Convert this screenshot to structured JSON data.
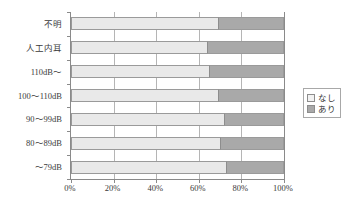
{
  "chart_data": {
    "type": "bar",
    "orientation": "horizontal",
    "stacked": true,
    "normalized": true,
    "title": "",
    "xlabel": "",
    "ylabel": "",
    "xlim": [
      0,
      100
    ],
    "grid": true,
    "legend_position": "right",
    "xticks": [
      "0%",
      "20%",
      "40%",
      "60%",
      "80%",
      "100%"
    ],
    "xtick_values": [
      0,
      20,
      40,
      60,
      80,
      100
    ],
    "categories": [
      "不明",
      "人工内耳",
      "110dB～",
      "100～110dB",
      "90～99dB",
      "80～89dB",
      "～79dB"
    ],
    "series": [
      {
        "name": "なし",
        "color": "#e9e9e9",
        "values": [
          69,
          64,
          65,
          69,
          72,
          70,
          73
        ]
      },
      {
        "name": "あり",
        "color": "#a9a9a9",
        "values": [
          31,
          36,
          35,
          31,
          28,
          30,
          27
        ]
      }
    ],
    "legend": [
      {
        "label": "なし",
        "color": "#e9e9e9"
      },
      {
        "label": "あり",
        "color": "#a9a9a9"
      }
    ]
  }
}
